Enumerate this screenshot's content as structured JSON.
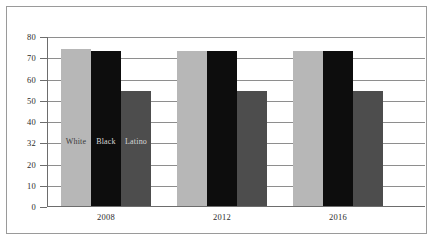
{
  "chart_data": {
    "type": "bar",
    "title": "",
    "subtitle": "",
    "xlabel": "",
    "ylabel": "",
    "ylim": [
      0,
      80
    ],
    "grid": true,
    "legend_position": "inline-on-bars",
    "categories": [
      "2008",
      "2012",
      "2016"
    ],
    "ytick_labels": [
      "0",
      "10",
      "20",
      "32",
      "40",
      "50",
      "60",
      "70",
      "80"
    ],
    "ytick_values": [
      0,
      10,
      20,
      30,
      40,
      50,
      60,
      70,
      80
    ],
    "series": [
      {
        "name": "White",
        "color": "#b7b7b7",
        "label_color": "#3a3a3a",
        "values": [
          74,
          73,
          73
        ]
      },
      {
        "name": "Black",
        "color": "#0d0d0d",
        "label_color": "#d8d8d8",
        "values": [
          73,
          73,
          73
        ]
      },
      {
        "name": "Latino",
        "color": "#4d4d4d",
        "label_color": "#d8d8d8",
        "values": [
          54,
          54,
          54
        ]
      }
    ],
    "colors": {
      "frame": "#9a9a9a",
      "gridline": "#8e8e8e",
      "axis": "#6d6d6d",
      "background": "#ffffff",
      "tick_text": "#2b2b2b"
    }
  }
}
